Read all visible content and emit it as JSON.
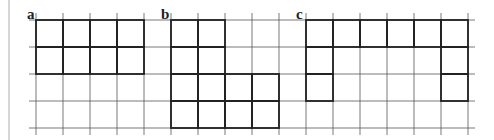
{
  "diagram": {
    "grid": {
      "origin_x": 36,
      "origin_y": 20,
      "cell": 27,
      "cols": 16,
      "rows": 4,
      "line_color": "#555555",
      "bold_color": "#222222"
    },
    "left_border_x": 9,
    "figures": [
      {
        "label": "a",
        "label_pos": [
          27,
          19
        ],
        "cells": [
          [
            0,
            0
          ],
          [
            1,
            0
          ],
          [
            2,
            0
          ],
          [
            3,
            0
          ],
          [
            0,
            1
          ],
          [
            1,
            1
          ],
          [
            2,
            1
          ],
          [
            3,
            1
          ]
        ]
      },
      {
        "label": "b",
        "label_pos": [
          161,
          19
        ],
        "cells": [
          [
            5,
            0
          ],
          [
            6,
            0
          ],
          [
            5,
            1
          ],
          [
            6,
            1
          ],
          [
            5,
            2
          ],
          [
            6,
            2
          ],
          [
            7,
            2
          ],
          [
            8,
            2
          ],
          [
            5,
            3
          ],
          [
            6,
            3
          ],
          [
            7,
            3
          ],
          [
            8,
            3
          ]
        ]
      },
      {
        "label": "c",
        "label_pos": [
          296,
          19
        ],
        "cells": [
          [
            10,
            0
          ],
          [
            11,
            0
          ],
          [
            12,
            0
          ],
          [
            13,
            0
          ],
          [
            14,
            0
          ],
          [
            15,
            0
          ],
          [
            10,
            1
          ],
          [
            10,
            2
          ],
          [
            15,
            1
          ],
          [
            15,
            2
          ]
        ]
      }
    ]
  }
}
